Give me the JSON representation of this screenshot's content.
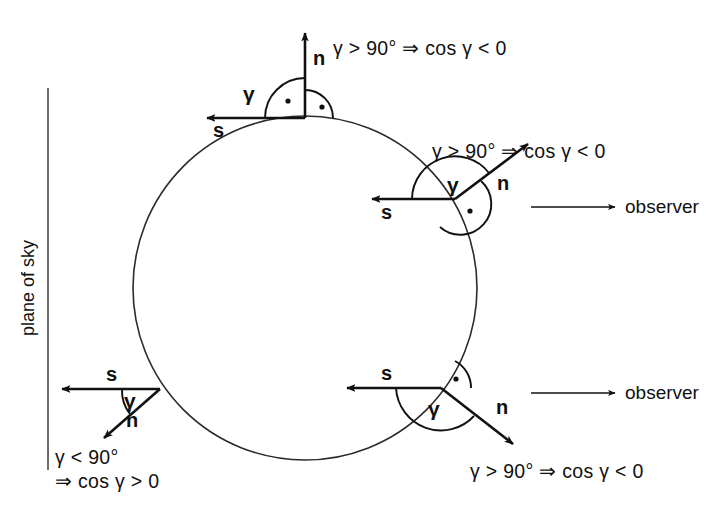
{
  "figure": {
    "plane_label": "plane of sky",
    "colors": {
      "ink": "#111111",
      "circle": "#2b2b2b",
      "background": "#ffffff"
    }
  },
  "vectors": {
    "normal_label": "n",
    "scatter_label": "s",
    "gamma_label": "γ"
  },
  "annotations": {
    "top": "γ > 90° ⇒ cos γ < 0",
    "middle_right": "γ > 90° ⇒ cos γ < 0",
    "bottom_right": "γ > 90° ⇒ cos γ < 0",
    "bottom_left_line1": "γ < 90°",
    "bottom_left_line2": "⇒ cos γ > 0"
  },
  "observers": {
    "upper": "observer",
    "lower": "observer"
  },
  "configurations": [
    {
      "id": "top",
      "vertex": [
        305,
        118
      ],
      "n_label": "n",
      "s_label": "s",
      "gamma_label": "γ",
      "gamma_value_text": "γ > 90° ⇒ cos γ < 0",
      "n_direction_deg": 90,
      "s_direction_deg": 180,
      "right_angle_marked": true
    },
    {
      "id": "middle-right",
      "vertex": [
        455,
        199
      ],
      "n_label": "n",
      "s_label": "s",
      "gamma_label": "γ",
      "gamma_value_text": "γ > 90° ⇒ cos γ < 0",
      "n_direction_deg": 37,
      "s_direction_deg": 180,
      "right_angle_marked": true
    },
    {
      "id": "bottom-left",
      "vertex": [
        160,
        389
      ],
      "n_label": "n",
      "s_label": "s",
      "gamma_label": "γ",
      "gamma_value_text": "γ < 90° ⇒ cos γ > 0",
      "n_direction_deg": 218,
      "s_direction_deg": 180,
      "right_angle_marked": false
    },
    {
      "id": "bottom-right",
      "vertex": [
        441,
        388
      ],
      "n_label": "n",
      "s_label": "s",
      "gamma_label": "γ",
      "gamma_value_text": "γ > 90° ⇒ cos γ < 0",
      "n_direction_deg": -36,
      "s_direction_deg": 180,
      "right_angle_marked": true
    }
  ],
  "geometry": {
    "circle_center": [
      305,
      288
    ],
    "circle_radius": 172,
    "plane_line_x": 48
  }
}
